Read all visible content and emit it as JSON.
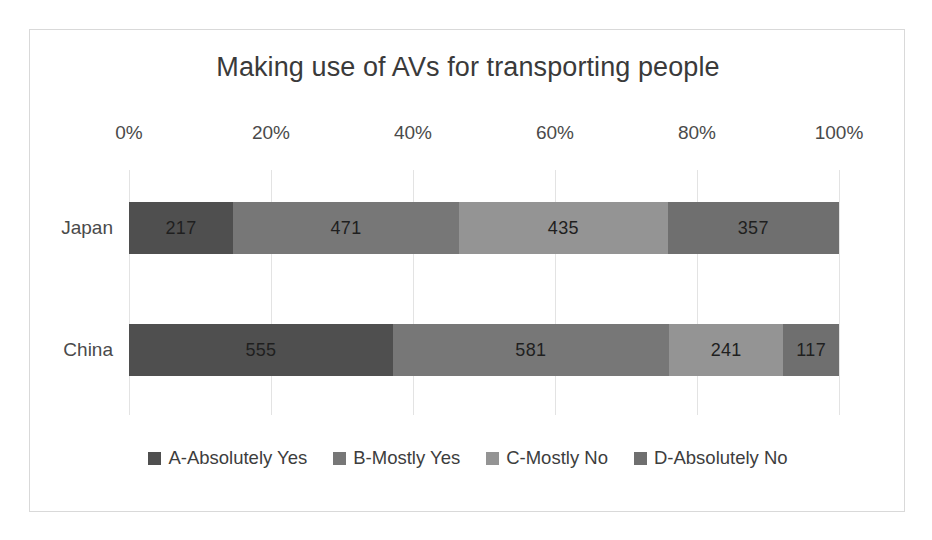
{
  "chart_data": {
    "type": "bar",
    "orientation": "horizontal",
    "stacked": true,
    "normalized": true,
    "title": "Making use of AVs for transporting people",
    "xlabel": "",
    "ylabel": "",
    "categories": [
      "Japan",
      "China"
    ],
    "tick_labels": [
      "0%",
      "20%",
      "40%",
      "60%",
      "80%",
      "100%"
    ],
    "tick_values": [
      0,
      20,
      40,
      60,
      80,
      100
    ],
    "xlim": [
      0,
      100
    ],
    "grid": true,
    "legend_position": "bottom",
    "series": [
      {
        "name": "A-Absolutely Yes",
        "color": "#4f4f4f",
        "values": [
          217,
          555
        ]
      },
      {
        "name": "B-Mostly Yes",
        "color": "#777777",
        "values": [
          471,
          581
        ]
      },
      {
        "name": "C-Mostly No",
        "color": "#949494",
        "values": [
          435,
          241
        ]
      },
      {
        "name": "D-Absolutely No",
        "color": "#6f6f6f",
        "values": [
          357,
          117
        ]
      }
    ],
    "rows": [
      {
        "category": "Japan",
        "total": 1480,
        "segments": [
          {
            "series": "A-Absolutely Yes",
            "value": "217",
            "percent": 14.66,
            "color": "#4f4f4f"
          },
          {
            "series": "B-Mostly Yes",
            "value": "471",
            "percent": 31.82,
            "color": "#777777"
          },
          {
            "series": "C-Mostly No",
            "value": "435",
            "percent": 29.39,
            "color": "#949494"
          },
          {
            "series": "D-Absolutely No",
            "value": "357",
            "percent": 24.12,
            "color": "#6f6f6f"
          }
        ]
      },
      {
        "category": "China",
        "total": 1494,
        "segments": [
          {
            "series": "A-Absolutely Yes",
            "value": "555",
            "percent": 37.15,
            "color": "#4f4f4f"
          },
          {
            "series": "B-Mostly Yes",
            "value": "581",
            "percent": 38.89,
            "color": "#777777"
          },
          {
            "series": "C-Mostly No",
            "value": "241",
            "percent": 16.13,
            "color": "#949494"
          },
          {
            "series": "D-Absolutely No",
            "value": "117",
            "percent": 7.83,
            "color": "#6f6f6f"
          }
        ]
      }
    ]
  },
  "legend": {
    "items": [
      {
        "label": "A-Absolutely Yes",
        "color": "#4f4f4f",
        "swatch_name": "legend-swatch-a"
      },
      {
        "label": "B-Mostly Yes",
        "color": "#777777",
        "swatch_name": "legend-swatch-b"
      },
      {
        "label": "C-Mostly No",
        "color": "#949494",
        "swatch_name": "legend-swatch-c"
      },
      {
        "label": "D-Absolutely No",
        "color": "#6f6f6f",
        "swatch_name": "legend-swatch-d"
      }
    ]
  },
  "style": {
    "border_color": "#d9d9d9",
    "grid_color": "#e3e3e3",
    "text_color": "#4a4a4a",
    "background": "#ffffff"
  }
}
